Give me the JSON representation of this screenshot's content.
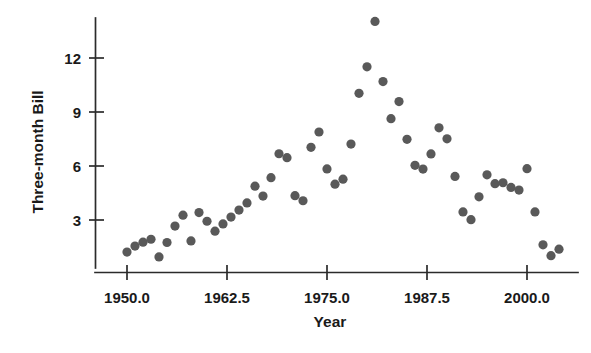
{
  "chart_data": {
    "type": "scatter",
    "title": "",
    "xlabel": "Year",
    "ylabel": "Three-month Bill",
    "xlim": [
      1947.0,
      2006.5
    ],
    "ylim": [
      0.3,
      14.6
    ],
    "grid": false,
    "legend": null,
    "marker": {
      "shape": "circle",
      "color": "#595959",
      "size_px": 4.6
    },
    "x_ticks": [
      {
        "value": 1950.0,
        "label": "1950.0"
      },
      {
        "value": 1962.5,
        "label": "1962.5"
      },
      {
        "value": 1975.0,
        "label": "1975.0"
      },
      {
        "value": 1987.5,
        "label": "1987.5"
      },
      {
        "value": 2000.0,
        "label": "2000.0"
      }
    ],
    "y_ticks": [
      {
        "value": 3,
        "label": "3"
      },
      {
        "value": 6,
        "label": "6"
      },
      {
        "value": 9,
        "label": "9"
      },
      {
        "value": 12,
        "label": "12"
      }
    ],
    "x": [
      1950,
      1951,
      1952,
      1953,
      1954,
      1955,
      1956,
      1957,
      1958,
      1959,
      1960,
      1961,
      1962,
      1963,
      1964,
      1965,
      1966,
      1967,
      1968,
      1969,
      1970,
      1971,
      1972,
      1973,
      1974,
      1975,
      1976,
      1977,
      1978,
      1979,
      1980,
      1981,
      1982,
      1983,
      1984,
      1985,
      1986,
      1987,
      1988,
      1989,
      1990,
      1991,
      1992,
      1993,
      1994,
      1995,
      1996,
      1997,
      1998,
      1999,
      2000,
      2001,
      2002,
      2003,
      2004
    ],
    "y": [
      1.22,
      1.55,
      1.77,
      1.93,
      0.95,
      1.75,
      2.66,
      3.27,
      1.84,
      3.41,
      2.93,
      2.38,
      2.78,
      3.16,
      3.55,
      3.95,
      4.88,
      4.33,
      5.35,
      6.68,
      6.46,
      4.35,
      4.07,
      7.04,
      7.89,
      5.84,
      4.99,
      5.27,
      7.22,
      10.04,
      11.51,
      14.03,
      10.69,
      8.63,
      9.58,
      7.48,
      6.04,
      5.83,
      6.67,
      8.12,
      7.51,
      5.42,
      3.45,
      3.02,
      4.29,
      5.51,
      5.02,
      5.07,
      4.81,
      4.66,
      5.85,
      3.45,
      1.62,
      1.02,
      1.38
    ],
    "series": [
      {
        "name": "Three-month Bill",
        "points": [
          {
            "x": 1950,
            "y": 1.22
          },
          {
            "x": 1951,
            "y": 1.55
          },
          {
            "x": 1952,
            "y": 1.77
          },
          {
            "x": 1953,
            "y": 1.93
          },
          {
            "x": 1954,
            "y": 0.95
          },
          {
            "x": 1955,
            "y": 1.75
          },
          {
            "x": 1956,
            "y": 2.66
          },
          {
            "x": 1957,
            "y": 3.27
          },
          {
            "x": 1958,
            "y": 1.84
          },
          {
            "x": 1959,
            "y": 3.41
          },
          {
            "x": 1960,
            "y": 2.93
          },
          {
            "x": 1961,
            "y": 2.38
          },
          {
            "x": 1962,
            "y": 2.78
          },
          {
            "x": 1963,
            "y": 3.16
          },
          {
            "x": 1964,
            "y": 3.55
          },
          {
            "x": 1965,
            "y": 3.95
          },
          {
            "x": 1966,
            "y": 4.88
          },
          {
            "x": 1967,
            "y": 4.33
          },
          {
            "x": 1968,
            "y": 5.35
          },
          {
            "x": 1969,
            "y": 6.68
          },
          {
            "x": 1970,
            "y": 6.46
          },
          {
            "x": 1971,
            "y": 4.35
          },
          {
            "x": 1972,
            "y": 4.07
          },
          {
            "x": 1973,
            "y": 7.04
          },
          {
            "x": 1974,
            "y": 7.89
          },
          {
            "x": 1975,
            "y": 5.84
          },
          {
            "x": 1976,
            "y": 4.99
          },
          {
            "x": 1977,
            "y": 5.27
          },
          {
            "x": 1978,
            "y": 7.22
          },
          {
            "x": 1979,
            "y": 10.04
          },
          {
            "x": 1980,
            "y": 11.51
          },
          {
            "x": 1981,
            "y": 14.03
          },
          {
            "x": 1982,
            "y": 10.69
          },
          {
            "x": 1983,
            "y": 8.63
          },
          {
            "x": 1984,
            "y": 9.58
          },
          {
            "x": 1985,
            "y": 7.48
          },
          {
            "x": 1986,
            "y": 6.04
          },
          {
            "x": 1987,
            "y": 5.83
          },
          {
            "x": 1988,
            "y": 6.67
          },
          {
            "x": 1989,
            "y": 8.12
          },
          {
            "x": 1990,
            "y": 7.51
          },
          {
            "x": 1991,
            "y": 5.42
          },
          {
            "x": 1992,
            "y": 3.45
          },
          {
            "x": 1993,
            "y": 3.02
          },
          {
            "x": 1994,
            "y": 4.29
          },
          {
            "x": 1995,
            "y": 5.51
          },
          {
            "x": 1996,
            "y": 5.02
          },
          {
            "x": 1997,
            "y": 5.07
          },
          {
            "x": 1998,
            "y": 4.81
          },
          {
            "x": 1999,
            "y": 4.66
          },
          {
            "x": 2000,
            "y": 5.85
          },
          {
            "x": 2001,
            "y": 3.45
          },
          {
            "x": 2002,
            "y": 1.62
          },
          {
            "x": 2003,
            "y": 1.02
          },
          {
            "x": 2004,
            "y": 1.38
          }
        ]
      }
    ]
  },
  "axes": {
    "y_axis_title": "Three-month Bill",
    "x_axis_title": "Year"
  }
}
